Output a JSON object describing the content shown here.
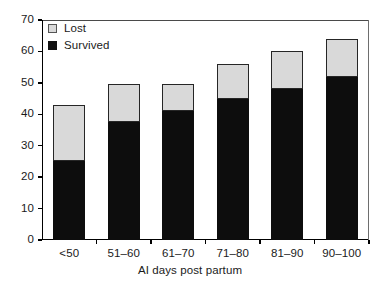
{
  "chart_data": {
    "type": "bar",
    "subtype": "stacked",
    "title": "",
    "xlabel": "AI days post partum",
    "ylabel": "",
    "categories": [
      "<50",
      "51–60",
      "61–70",
      "71–80",
      "81–90",
      "90–100"
    ],
    "series": [
      {
        "name": "Survived",
        "color": "#0d0d0d",
        "values": [
          25,
          37.5,
          41,
          45,
          48,
          52
        ]
      },
      {
        "name": "Lost",
        "color": "#d9d9d9",
        "values": [
          18,
          12,
          8.5,
          11,
          12,
          12
        ]
      }
    ],
    "totals": [
      43,
      49.5,
      49.5,
      56,
      60,
      64
    ],
    "ylim": [
      0,
      70
    ],
    "ytick_values": [
      0,
      10,
      20,
      30,
      40,
      50,
      60,
      70
    ],
    "ytick_labels": [
      "0",
      "10",
      "20",
      "30",
      "40",
      "50",
      "60",
      "70"
    ],
    "grid": false,
    "legend_position": "top-left",
    "legend_order": [
      "Lost",
      "Survived"
    ]
  },
  "legend": {
    "items": [
      {
        "label": "Lost",
        "swatch": "lost-swatch-icon"
      },
      {
        "label": "Survived",
        "swatch": "survived-swatch-icon"
      }
    ]
  },
  "axes": {
    "x_title": "AI days post partum"
  }
}
